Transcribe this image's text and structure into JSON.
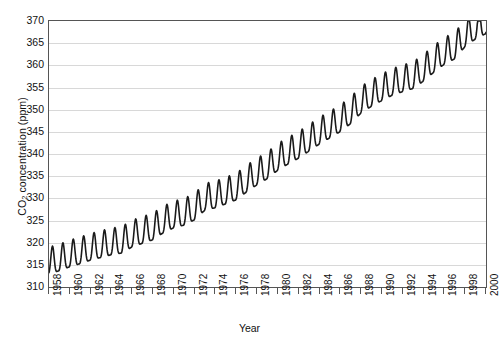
{
  "chart_data": {
    "type": "line",
    "title": "",
    "xlabel": "Year",
    "ylabel_prefix": "CO",
    "ylabel_sub": "2",
    "ylabel_suffix": " concentration (ppm)",
    "ylabel_plain": "CO2 concentration (ppm)",
    "xlim": [
      1958,
      2000
    ],
    "ylim": [
      310,
      370
    ],
    "yticks": [
      310,
      315,
      320,
      325,
      330,
      335,
      340,
      345,
      350,
      355,
      360,
      365,
      370
    ],
    "xticks": [
      1958,
      1960,
      1962,
      1964,
      1966,
      1968,
      1970,
      1972,
      1974,
      1976,
      1978,
      1980,
      1982,
      1984,
      1986,
      1988,
      1990,
      1992,
      1994,
      1996,
      1998,
      2000
    ],
    "grid": "horizontal",
    "legend": "none",
    "line_color": "#1a1a1a",
    "line_width": 1.6,
    "grid_color": "#d8d8d8",
    "axis_color": "#555555",
    "background": "#ffffff",
    "series_name": "Atmospheric CO2 concentration",
    "seasonal_amplitude_ppm": 3.0,
    "seasonal_peak_month": 5,
    "annual_means": [
      {
        "year": 1958,
        "value": 315.3
      },
      {
        "year": 1959,
        "value": 316.0
      },
      {
        "year": 1960,
        "value": 316.9
      },
      {
        "year": 1961,
        "value": 317.6
      },
      {
        "year": 1962,
        "value": 318.4
      },
      {
        "year": 1963,
        "value": 319.0
      },
      {
        "year": 1964,
        "value": 319.6
      },
      {
        "year": 1965,
        "value": 320.0
      },
      {
        "year": 1966,
        "value": 321.4
      },
      {
        "year": 1967,
        "value": 322.2
      },
      {
        "year": 1968,
        "value": 323.0
      },
      {
        "year": 1969,
        "value": 324.6
      },
      {
        "year": 1970,
        "value": 325.7
      },
      {
        "year": 1971,
        "value": 326.3
      },
      {
        "year": 1972,
        "value": 327.5
      },
      {
        "year": 1973,
        "value": 329.7
      },
      {
        "year": 1974,
        "value": 330.2
      },
      {
        "year": 1975,
        "value": 331.1
      },
      {
        "year": 1976,
        "value": 332.0
      },
      {
        "year": 1977,
        "value": 333.8
      },
      {
        "year": 1978,
        "value": 335.4
      },
      {
        "year": 1979,
        "value": 336.8
      },
      {
        "year": 1980,
        "value": 338.7
      },
      {
        "year": 1981,
        "value": 340.1
      },
      {
        "year": 1982,
        "value": 341.4
      },
      {
        "year": 1983,
        "value": 343.0
      },
      {
        "year": 1984,
        "value": 344.6
      },
      {
        "year": 1985,
        "value": 346.0
      },
      {
        "year": 1986,
        "value": 347.4
      },
      {
        "year": 1987,
        "value": 349.2
      },
      {
        "year": 1988,
        "value": 351.6
      },
      {
        "year": 1989,
        "value": 353.1
      },
      {
        "year": 1990,
        "value": 354.4
      },
      {
        "year": 1991,
        "value": 355.6
      },
      {
        "year": 1992,
        "value": 356.4
      },
      {
        "year": 1993,
        "value": 357.1
      },
      {
        "year": 1994,
        "value": 358.8
      },
      {
        "year": 1995,
        "value": 360.8
      },
      {
        "year": 1996,
        "value": 362.6
      },
      {
        "year": 1997,
        "value": 363.8
      },
      {
        "year": 1998,
        "value": 366.6
      },
      {
        "year": 1999,
        "value": 368.3
      },
      {
        "year": 2000,
        "value": 369.5
      }
    ]
  }
}
